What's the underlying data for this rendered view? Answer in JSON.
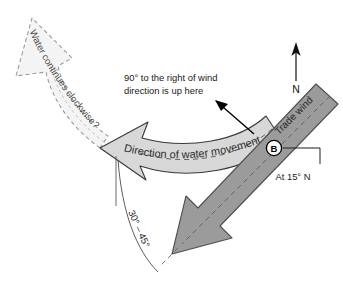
{
  "diagram": {
    "colors": {
      "wind_arrow_fill": "#9b9b9b",
      "wind_arrow_stroke": "#4f4f4f",
      "water_band_fill": "#d8d8d8",
      "water_band_stroke": "#3a3a3a",
      "ghost_arrow_fill": "#f4f4f4",
      "ghost_arrow_stroke": "#9a9a9a",
      "text": "#1a1a1a",
      "background": "#ffffff"
    },
    "annotations": {
      "ekman_note_line1": "90° to the right of wind",
      "ekman_note_line2": "direction is up here",
      "water_movement_label": "Direction of water movement",
      "ghost_arrow_label": "Water continues clockwise?",
      "trade_wind_label": "Trade wind",
      "latitude_label": "At 15° N",
      "angle_label": "30° – 45°",
      "angle_label_part1": "30°",
      "angle_label_part2": "– 45°",
      "point_marker": "B",
      "compass_north": "N"
    }
  }
}
